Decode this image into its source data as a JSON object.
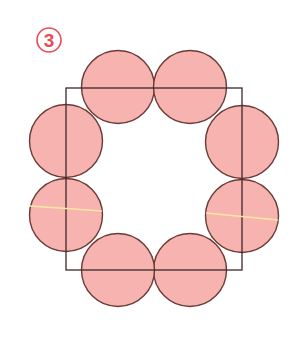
{
  "figure": {
    "label": "3",
    "colors": {
      "circle_fill": "#f6b3b0",
      "circle_stroke": "#6b3a36",
      "square_stroke": "#3b2a28",
      "badge_color": "#ea4a55",
      "highlight_line": "#fbe7a1",
      "background": "#ffffff"
    },
    "square": {
      "x": 66,
      "y": 88,
      "width": 176,
      "height": 182
    },
    "circle_radius": 36.5,
    "circles": [
      {
        "id": "top-left",
        "cx": 118,
        "cy": 87
      },
      {
        "id": "top-right",
        "cx": 190,
        "cy": 87
      },
      {
        "id": "right-top",
        "cx": 242,
        "cy": 142
      },
      {
        "id": "right-bottom",
        "cx": 242,
        "cy": 216
      },
      {
        "id": "bottom-right",
        "cx": 190,
        "cy": 270
      },
      {
        "id": "bottom-left",
        "cx": 118,
        "cy": 270
      },
      {
        "id": "left-bottom",
        "cx": 66,
        "cy": 215
      },
      {
        "id": "left-top",
        "cx": 66,
        "cy": 141
      }
    ],
    "highlight_lines": [
      {
        "id": "left-diameter",
        "x1": 30,
        "y1": 206,
        "x2": 102,
        "y2": 211
      },
      {
        "id": "right-diameter",
        "x1": 206,
        "y1": 213,
        "x2": 278,
        "y2": 220
      }
    ]
  }
}
